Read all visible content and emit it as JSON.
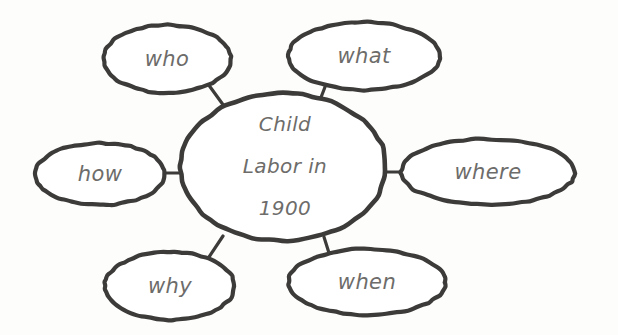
{
  "diagram": {
    "type": "concept-web",
    "title": "Child Labor in 1900",
    "center": {
      "id": "center",
      "lines": [
        "Child",
        "Labor in",
        "1900"
      ],
      "shape": "ellipse",
      "cx": 283,
      "cy": 167,
      "rx": 103,
      "ry": 74
    },
    "branches": [
      {
        "id": "who",
        "label": "who",
        "shape": "ellipse",
        "cx": 167,
        "cy": 59,
        "rx": 64,
        "ry": 34
      },
      {
        "id": "what",
        "label": "what",
        "shape": "ellipse",
        "cx": 364,
        "cy": 56,
        "rx": 76,
        "ry": 34
      },
      {
        "id": "where",
        "label": "where",
        "shape": "ellipse",
        "cx": 488,
        "cy": 172,
        "rx": 87,
        "ry": 33
      },
      {
        "id": "when",
        "label": "when",
        "shape": "ellipse",
        "cx": 367,
        "cy": 282,
        "rx": 79,
        "ry": 33
      },
      {
        "id": "why",
        "label": "why",
        "shape": "ellipse",
        "cx": 170,
        "cy": 286,
        "rx": 65,
        "ry": 34
      },
      {
        "id": "how",
        "label": "how",
        "shape": "ellipse",
        "cx": 100,
        "cy": 174,
        "rx": 65,
        "ry": 31
      }
    ],
    "connectors": [
      {
        "id": "who-center",
        "from": "who",
        "to": "center",
        "x1": 208,
        "y1": 84,
        "x2": 224,
        "y2": 106
      },
      {
        "id": "what-center",
        "from": "what",
        "to": "center",
        "x1": 325,
        "y1": 87,
        "x2": 320,
        "y2": 100
      },
      {
        "id": "where-center",
        "from": "where",
        "to": "center",
        "x1": 401,
        "y1": 172,
        "x2": 386,
        "y2": 172
      },
      {
        "id": "when-center",
        "from": "when",
        "to": "center",
        "x1": 329,
        "y1": 253,
        "x2": 324,
        "y2": 237
      },
      {
        "id": "why-center",
        "from": "why",
        "to": "center",
        "x1": 209,
        "y1": 257,
        "x2": 223,
        "y2": 236
      },
      {
        "id": "how-center",
        "from": "how",
        "to": "center",
        "x1": 165,
        "y1": 173,
        "x2": 181,
        "y2": 173
      }
    ],
    "colors": {
      "stroke": "#3c3b39",
      "text": "#6d6c6a",
      "bubble_fill": "#ffffff",
      "background": "#fdfdfc"
    },
    "stroke_widths": {
      "bubble": 4.2,
      "connector": 3.2
    }
  }
}
